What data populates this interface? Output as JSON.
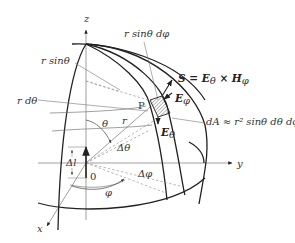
{
  "diagram": {
    "axes": {
      "z": "z",
      "y": "y",
      "x": "x",
      "origin": "0"
    },
    "labels": {
      "r_sin_theta": "r sinθ",
      "r_sin_theta_dphi": "r sinθ dφ",
      "r_dtheta": "r dθ",
      "poynting": "S = E",
      "poynting_sub1": "θ",
      "poynting_times": " × H",
      "poynting_sub2": "φ",
      "E_phi": "E",
      "E_phi_sub": "φ",
      "E_theta": "E",
      "E_theta_sub": "θ",
      "dA": "dA ≈ r² sinθ dθ dφ",
      "point_P": "P",
      "theta": "θ",
      "r": "r",
      "delta_theta": "Δθ",
      "delta_l": "Δl",
      "delta_phi": "Δφ",
      "phi": "φ"
    },
    "colors": {
      "line": "#222222",
      "thin_line": "#777777",
      "dashed": "#999999",
      "hatch": "#555555"
    }
  }
}
